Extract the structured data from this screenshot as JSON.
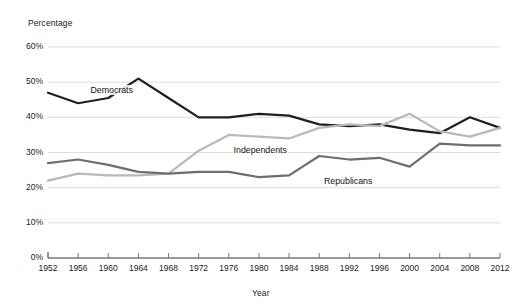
{
  "chart_data": {
    "type": "line",
    "title": "",
    "xlabel": "Year",
    "ylabel": "Percentage",
    "xlim": [
      1952,
      2012
    ],
    "ylim": [
      0,
      60
    ],
    "grid": true,
    "legend_position": "inline-labels",
    "x": [
      1952,
      1956,
      1960,
      1964,
      1968,
      1972,
      1976,
      1980,
      1984,
      1988,
      1992,
      1996,
      2000,
      2004,
      2008,
      2012
    ],
    "y_ticks": [
      0,
      10,
      20,
      30,
      40,
      50,
      60
    ],
    "y_tick_labels": [
      "0%",
      "10%",
      "20%",
      "30%",
      "40%",
      "50%",
      "60%"
    ],
    "x_tick_labels": [
      "1952",
      "1956",
      "1960",
      "1964",
      "1968",
      "1972",
      "1976",
      "1980",
      "1984",
      "1988",
      "1992",
      "1996",
      "2000",
      "2004",
      "2008",
      "2012"
    ],
    "series": [
      {
        "name": "Democrats",
        "color": "#1f1f1f",
        "label_x": 1957.5,
        "label_y": 47.6,
        "values": [
          47,
          44,
          45.5,
          51,
          45.5,
          40,
          40,
          41,
          40.5,
          38,
          37.5,
          38,
          36.5,
          35.5,
          40,
          37
        ]
      },
      {
        "name": "Independents",
        "color": "#b9b9b9",
        "label_x": 1976.5,
        "label_y": 30.5,
        "values": [
          22,
          24,
          23.5,
          23.5,
          24,
          30.5,
          35,
          34.5,
          34,
          37,
          38,
          37.5,
          41,
          36,
          34.5,
          37
        ]
      },
      {
        "name": "Republicans",
        "color": "#6e6e6e",
        "label_x": 1988.5,
        "label_y": 21.5,
        "values": [
          27,
          28,
          26.5,
          24.5,
          24,
          24.5,
          24.5,
          23,
          23.5,
          29,
          28,
          28.5,
          26,
          32.5,
          32,
          32
        ]
      }
    ]
  },
  "plot": {
    "x_left": 48,
    "x_right": 500,
    "y_bottom": 258,
    "y_top": 47
  }
}
